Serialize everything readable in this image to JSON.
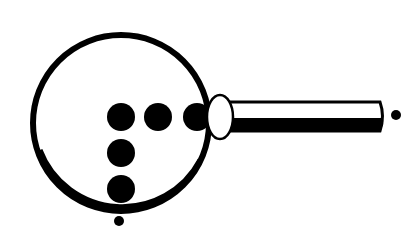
{
  "illustration": {
    "subject": "magnifying glass over braille-like dot pattern",
    "colors": {
      "ink": "#000000",
      "background": "#ffffff"
    },
    "lens": {
      "cx": 121,
      "cy": 123,
      "r": 88,
      "stroke": 7
    },
    "dots": [
      {
        "cx": 121,
        "cy": 117,
        "r": 14
      },
      {
        "cx": 158,
        "cy": 117,
        "r": 14
      },
      {
        "cx": 197,
        "cy": 117,
        "r": 14
      },
      {
        "cx": 121,
        "cy": 153,
        "r": 14
      },
      {
        "cx": 121,
        "cy": 189,
        "r": 14
      }
    ],
    "ferrule": {
      "cx": 220,
      "cy": 117,
      "rx": 13,
      "ry": 22
    },
    "handle": {
      "x": 228,
      "y": 101,
      "width": 155,
      "height": 31
    },
    "marker_dots": [
      {
        "cx": 396,
        "cy": 115,
        "r": 5
      },
      {
        "cx": 119,
        "cy": 221,
        "r": 5
      }
    ]
  }
}
